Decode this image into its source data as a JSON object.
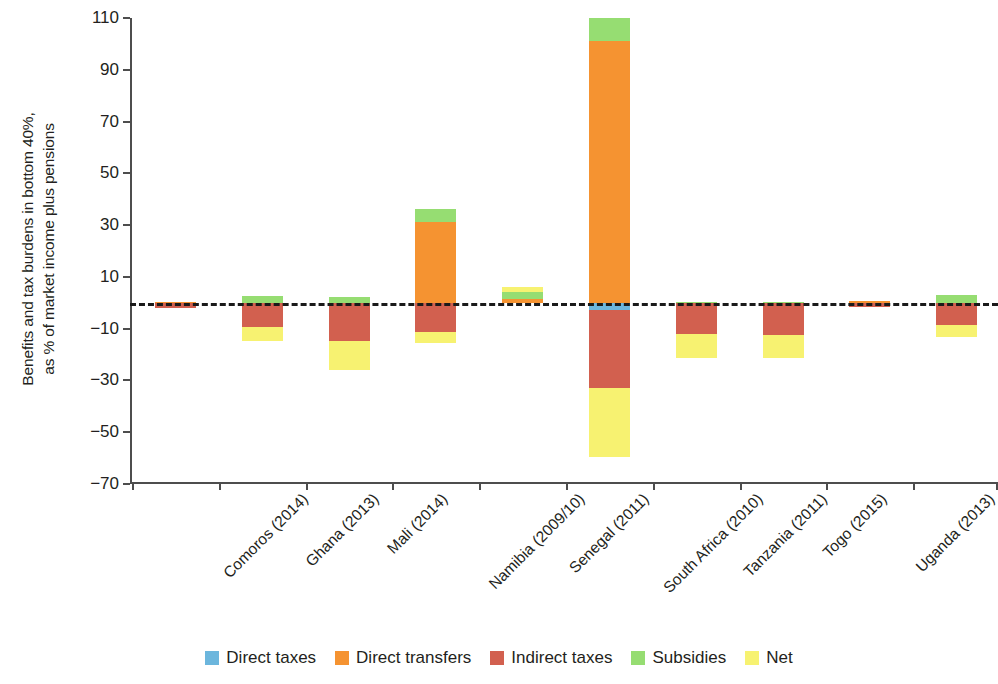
{
  "chart_data": {
    "type": "bar",
    "title": "",
    "subtitle": "",
    "xlabel": "",
    "ylabel": "Benefits and tax burdens in bottom 40%,\nas % of market income plus pensions",
    "ylim": [
      -70,
      110
    ],
    "yticks": [
      -70,
      -50,
      -30,
      -10,
      10,
      30,
      50,
      70,
      90,
      110
    ],
    "ytick_labels": [
      "−70",
      "−50",
      "−30",
      "−10",
      "10",
      "30",
      "50",
      "70",
      "90",
      "110"
    ],
    "grid": false,
    "stacked": true,
    "zero_reference_line": true,
    "legend_position": "bottom",
    "categories": [
      "Comoros (2014)",
      "Ghana (2013)",
      "Mali (2014)",
      "Namibia (2009/10)",
      "Senegal (2011)",
      "South Africa (2010)",
      "Tanzania (2011)",
      "Togo (2015)",
      "Uganda (2013)",
      "Zambia (2015)"
    ],
    "series": [
      {
        "name": "Direct taxes",
        "color": "#6cb6dd",
        "values": [
          0,
          0,
          0,
          0,
          0,
          -2.7,
          0,
          0,
          0,
          0
        ]
      },
      {
        "name": "Direct transfers",
        "color": "#f59331",
        "values": [
          0.2,
          0.4,
          0.3,
          31.3,
          1.5,
          101.0,
          0.2,
          0.2,
          0.6,
          0.4
        ]
      },
      {
        "name": "Indirect taxes",
        "color": "#d2604f",
        "values": [
          -2.0,
          -9.3,
          -14.7,
          -11.2,
          0,
          -30.2,
          -12.0,
          -12.4,
          -1.8,
          -8.5
        ]
      },
      {
        "name": "Subsidies",
        "color": "#96dd72",
        "values": [
          0,
          2.7,
          2.3,
          5.0,
          4.2,
          9.0,
          0.3,
          0.2,
          0.2,
          3.1
        ]
      },
      {
        "name": "Net",
        "color": "#f7f271",
        "values": [
          -2.0,
          -14.7,
          -25.9,
          -15.4,
          6.2,
          -59.5,
          -21.2,
          -21.2,
          -1.6,
          -13.1
        ]
      }
    ]
  },
  "legend": {
    "items": [
      {
        "label": "Direct taxes",
        "color": "#6cb6dd",
        "key": "direct_taxes"
      },
      {
        "label": "Direct transfers",
        "color": "#f59331",
        "key": "direct_transfers"
      },
      {
        "label": "Indirect taxes",
        "color": "#d2604f",
        "key": "indirect_taxes"
      },
      {
        "label": "Subsidies",
        "color": "#96dd72",
        "key": "subsidies"
      },
      {
        "label": "Net",
        "color": "#f7f271",
        "key": "net"
      }
    ]
  },
  "bar_segments": [
    {
      "category": "Comoros (2014)",
      "segments": [
        {
          "key": "direct_transfers",
          "top": 0.2,
          "bottom": 0.0
        },
        {
          "key": "indirect_taxes",
          "top": 0.0,
          "bottom": -2.0
        }
      ]
    },
    {
      "category": "Ghana (2013)",
      "segments": [
        {
          "key": "subsidies",
          "top": 2.7,
          "bottom": 0.0
        },
        {
          "key": "indirect_taxes",
          "top": 0.0,
          "bottom": -9.3
        },
        {
          "key": "net",
          "top": -9.3,
          "bottom": -14.7
        }
      ]
    },
    {
      "category": "Mali (2014)",
      "segments": [
        {
          "key": "subsidies",
          "top": 2.3,
          "bottom": 0.0
        },
        {
          "key": "indirect_taxes",
          "top": 0.0,
          "bottom": -14.7
        },
        {
          "key": "net",
          "top": -14.7,
          "bottom": -25.9
        }
      ]
    },
    {
      "category": "Namibia (2009/10)",
      "segments": [
        {
          "key": "subsidies",
          "top": 36.3,
          "bottom": 31.3
        },
        {
          "key": "direct_transfers",
          "top": 31.3,
          "bottom": 0.0
        },
        {
          "key": "indirect_taxes",
          "top": 0.0,
          "bottom": -11.2
        },
        {
          "key": "net",
          "top": -11.2,
          "bottom": -15.4
        }
      ]
    },
    {
      "category": "Senegal (2011)",
      "segments": [
        {
          "key": "net",
          "top": 6.2,
          "bottom": 4.2
        },
        {
          "key": "subsidies",
          "top": 4.2,
          "bottom": 1.5
        },
        {
          "key": "direct_transfers",
          "top": 1.5,
          "bottom": 0.0
        }
      ]
    },
    {
      "category": "South Africa (2010)",
      "segments": [
        {
          "key": "subsidies",
          "top": 110.0,
          "bottom": 101.0
        },
        {
          "key": "direct_transfers",
          "top": 101.0,
          "bottom": 0.0
        },
        {
          "key": "direct_taxes",
          "top": 0.0,
          "bottom": -2.7
        },
        {
          "key": "indirect_taxes",
          "top": -2.7,
          "bottom": -32.8
        },
        {
          "key": "net",
          "top": -32.8,
          "bottom": -59.5
        }
      ]
    },
    {
      "category": "Tanzania (2011)",
      "segments": [
        {
          "key": "subsidies",
          "top": 0.3,
          "bottom": 0.0
        },
        {
          "key": "indirect_taxes",
          "top": 0.0,
          "bottom": -12.0
        },
        {
          "key": "net",
          "top": -12.0,
          "bottom": -21.2
        }
      ]
    },
    {
      "category": "Togo (2015)",
      "segments": [
        {
          "key": "subsidies",
          "top": 0.2,
          "bottom": 0.0
        },
        {
          "key": "indirect_taxes",
          "top": 0.0,
          "bottom": -12.4
        },
        {
          "key": "net",
          "top": -12.4,
          "bottom": -21.2
        }
      ]
    },
    {
      "category": "Uganda (2013)",
      "segments": [
        {
          "key": "direct_transfers",
          "top": 0.6,
          "bottom": 0.0
        },
        {
          "key": "indirect_taxes",
          "top": 0.0,
          "bottom": -1.8
        }
      ]
    },
    {
      "category": "Zambia (2015)",
      "segments": [
        {
          "key": "subsidies",
          "top": 3.1,
          "bottom": 0.0
        },
        {
          "key": "indirect_taxes",
          "top": 0.0,
          "bottom": -8.5
        },
        {
          "key": "net",
          "top": -8.5,
          "bottom": -13.1
        }
      ]
    }
  ]
}
